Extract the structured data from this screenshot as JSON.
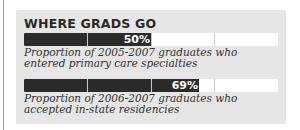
{
  "panel": {
    "title": "WHERE GRADS GO"
  },
  "bars": [
    {
      "value": 50,
      "label": "50%",
      "caption": "Proportion of 2005-2007 graduates who entered primary care specialties"
    },
    {
      "value": 69,
      "label": "69%",
      "caption": "Proportion of 2006-2007 graduates who accepted in-state residencies"
    }
  ],
  "colors": {
    "panel_bg": "#e6e6e6",
    "fill": "#2b2b2b",
    "track": "#ffffff",
    "divider": "#c8c8c8"
  },
  "chart_data": {
    "type": "bar",
    "title": "WHERE GRADS GO",
    "orientation": "horizontal",
    "categories": [
      "Proportion of 2005-2007 graduates who entered primary care specialties",
      "Proportion of 2006-2007 graduates who accepted in-state residencies"
    ],
    "values": [
      50,
      69
    ],
    "unit": "%",
    "xlim": [
      0,
      100
    ],
    "gridlines": [
      25,
      50,
      75
    ]
  }
}
